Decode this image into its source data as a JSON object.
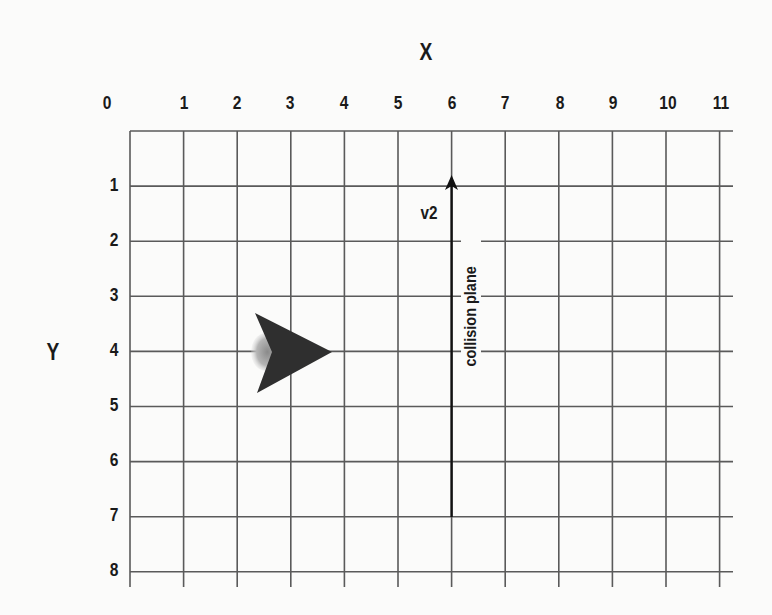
{
  "diagram": {
    "x_axis_title": "X",
    "y_axis_title": "Y",
    "x_ticks": [
      "0",
      "1",
      "2",
      "3",
      "4",
      "5",
      "6",
      "7",
      "8",
      "9",
      "10",
      "11"
    ],
    "y_ticks": [
      "1",
      "2",
      "3",
      "4",
      "5",
      "6",
      "7",
      "8"
    ],
    "vector_label": "v2",
    "plane_label": "collision plane",
    "ship": {
      "shape": "arrowhead",
      "tip": [
        4,
        4
      ],
      "position": [
        3,
        4
      ],
      "color": "#2f2f2f"
    },
    "vector": {
      "from": [
        6,
        7
      ],
      "to": [
        6,
        0.8
      ],
      "color": "#111111"
    },
    "colors": {
      "grid": "#555555",
      "background": "#fbfbfa",
      "text": "#1a1a1a"
    }
  }
}
